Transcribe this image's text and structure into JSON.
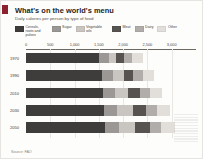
{
  "header": {
    "title": "What's on the world's menu",
    "subtitle": "Daily calories per person by type of food",
    "accent_color": "#8c2230"
  },
  "source": {
    "label": "Source: FAO"
  },
  "chart_data": {
    "type": "bar",
    "orientation": "horizontal",
    "stacked": true,
    "title": "What's on the world's menu",
    "subtitle": "Daily calories per person by type of food",
    "xlabel": "",
    "ylabel": "",
    "xlim": [
      0,
      3500
    ],
    "xticks": [
      0,
      500,
      1000,
      1500,
      2000,
      2500,
      3000
    ],
    "xtick_labels": [
      "0",
      "500",
      "1,000",
      "1,500",
      "2,000",
      "2,500",
      "3,000"
    ],
    "grid": true,
    "legend_position": "top",
    "categories": [
      "1970",
      "1990",
      "2010",
      "2030",
      "2050"
    ],
    "series": [
      {
        "name": "Cereals, roots and pulses",
        "color": "#3f3d3c",
        "values": [
          1500,
          1560,
          1580,
          1610,
          1620
        ]
      },
      {
        "name": "Sugar",
        "color": "#9a9794",
        "values": [
          200,
          230,
          250,
          270,
          285
        ]
      },
      {
        "name": "Vegetable oils",
        "color": "#c9c6c2",
        "values": [
          160,
          220,
          280,
          320,
          345
        ]
      },
      {
        "name": "Meat",
        "color": "#565350",
        "values": [
          160,
          200,
          240,
          280,
          300
        ]
      },
      {
        "name": "Dairy",
        "color": "#b0adaa",
        "values": [
          170,
          190,
          210,
          225,
          235
        ]
      },
      {
        "name": "Other",
        "color": "#e2dfdb",
        "values": [
          210,
          230,
          250,
          265,
          275
        ]
      }
    ]
  }
}
